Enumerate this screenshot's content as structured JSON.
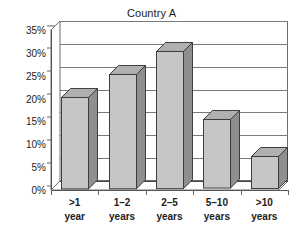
{
  "chart_data": {
    "type": "bar",
    "title": "Country A",
    "xlabel": "",
    "ylabel": "",
    "categories": [
      ">1 year",
      "1–2 years",
      "2–5 years",
      "5–10 years",
      ">10 years"
    ],
    "category_lines": [
      {
        "line1": ">1",
        "line2": "year"
      },
      {
        "line1": "1–2",
        "line2": "years"
      },
      {
        "line1": "2–5",
        "line2": "years"
      },
      {
        "line1": "5–10",
        "line2": "years"
      },
      {
        "line1": ">10",
        "line2": "years"
      }
    ],
    "values": [
      20,
      25,
      30,
      15,
      7
    ],
    "value_labels": [
      "20%",
      "25%",
      "30%",
      "15%",
      "7%"
    ],
    "ylim": [
      0,
      35
    ],
    "ytick_values": [
      0,
      5,
      10,
      15,
      20,
      25,
      30,
      35
    ],
    "ytick_labels": [
      "0%",
      "5%",
      "10%",
      "15%",
      "20%",
      "25%",
      "30%",
      "35%"
    ],
    "grid": true,
    "legend": false,
    "legend_position": "none",
    "three_d": true,
    "colors": {
      "bar_front": "#c6c6c6",
      "bar_side": "#8f8f8f",
      "bar_top": "#b0b0b0",
      "bar_outline": "#3d3d3d",
      "gridline": "#7a7a7a",
      "axis": "#555555",
      "text": "#222222",
      "background": "#ffffff"
    }
  }
}
